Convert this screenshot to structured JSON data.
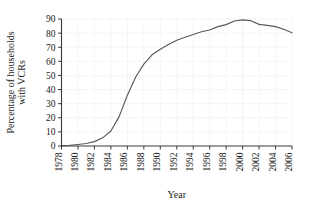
{
  "chart_data": {
    "type": "line",
    "title": "",
    "xlabel": "Year",
    "ylabel": "Percentage of households with VCRs",
    "ylabel_lines": [
      "Percentage of households",
      "with VCRs"
    ],
    "xlim": [
      1978,
      2006
    ],
    "ylim": [
      0,
      90
    ],
    "grid": true,
    "legend": "none",
    "line_color": "#5a5a5a",
    "axis_color": "#3a3a3a",
    "grid_color": "#f2f2f2",
    "xticks": [
      1978,
      1980,
      1982,
      1984,
      1986,
      1988,
      1990,
      1992,
      1994,
      1996,
      1998,
      2000,
      2002,
      2004,
      2006
    ],
    "xtick_labels": [
      "1978",
      "1980",
      "1982",
      "1984",
      "1986",
      "1988",
      "1990",
      "1992",
      "1994",
      "1996",
      "1998",
      "2000",
      "2002",
      "2004",
      "2006"
    ],
    "yticks": [
      0,
      10,
      20,
      30,
      40,
      50,
      60,
      70,
      80,
      90
    ],
    "ytick_labels": [
      "0",
      "10",
      "20",
      "30",
      "40",
      "50",
      "60",
      "70",
      "80",
      "90"
    ],
    "x": [
      1978,
      1979,
      1980,
      1981,
      1982,
      1983,
      1984,
      1985,
      1986,
      1987,
      1988,
      1989,
      1990,
      1991,
      1992,
      1993,
      1994,
      1995,
      1996,
      1997,
      1998,
      1999,
      2000,
      2001,
      2002,
      2003,
      2004,
      2005,
      2006
    ],
    "values": [
      0.3,
      0.5,
      1.1,
      1.8,
      3.1,
      5.8,
      10.6,
      20.8,
      36.0,
      48.7,
      58.0,
      64.6,
      68.6,
      71.9,
      75.0,
      77.1,
      79.0,
      81.0,
      82.2,
      84.6,
      86.0,
      88.6,
      89.4,
      88.8,
      86.2,
      85.5,
      84.6,
      82.7,
      80.2
    ]
  }
}
